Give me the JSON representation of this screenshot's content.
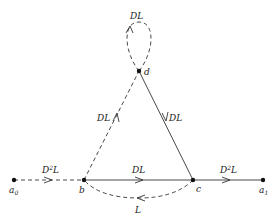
{
  "colors": {
    "stroke": "#333333",
    "node": "#111111",
    "text": "#222222",
    "background": "#ffffff"
  },
  "nodes": [
    {
      "id": "a0",
      "label": "a",
      "subscript": "0",
      "x": 14,
      "y": 180
    },
    {
      "id": "b",
      "label": "b",
      "x": 84,
      "y": 180
    },
    {
      "id": "c",
      "label": "c",
      "x": 193,
      "y": 180
    },
    {
      "id": "a1",
      "label": "a",
      "subscript": "1",
      "x": 263,
      "y": 180
    },
    {
      "id": "d",
      "label": "d",
      "x": 139,
      "y": 71
    }
  ],
  "edges": [
    {
      "from": "a0",
      "to": "b",
      "style": "dashed",
      "label": "D",
      "label_sup": "2",
      "label_tail": "L"
    },
    {
      "from": "b",
      "to": "c",
      "style": "solid",
      "label": "DL"
    },
    {
      "from": "c",
      "to": "b",
      "style": "dashed",
      "curved": true,
      "label": "L"
    },
    {
      "from": "c",
      "to": "a1",
      "style": "solid",
      "label": "D",
      "label_sup": "2",
      "label_tail": "L"
    },
    {
      "from": "b",
      "to": "d",
      "style": "dashed",
      "label": "DL"
    },
    {
      "from": "d",
      "to": "c",
      "style": "solid",
      "label": "DL"
    },
    {
      "from": "d",
      "to": "d",
      "style": "dashed",
      "loop": true,
      "label": "DL"
    }
  ],
  "labels": {
    "a0_main": "a",
    "a0_sub": "0",
    "b": "b",
    "c": "c",
    "d": "d",
    "a1_main": "a",
    "a1_sub": "1",
    "e_a0b_main": "D",
    "e_a0b_sup": "2",
    "e_a0b_tail": "L",
    "e_bc": "DL",
    "e_cb": "L",
    "e_ca1_main": "D",
    "e_ca1_sup": "2",
    "e_ca1_tail": "L",
    "e_bd": "DL",
    "e_dc": "DL",
    "e_dd": "DL"
  }
}
